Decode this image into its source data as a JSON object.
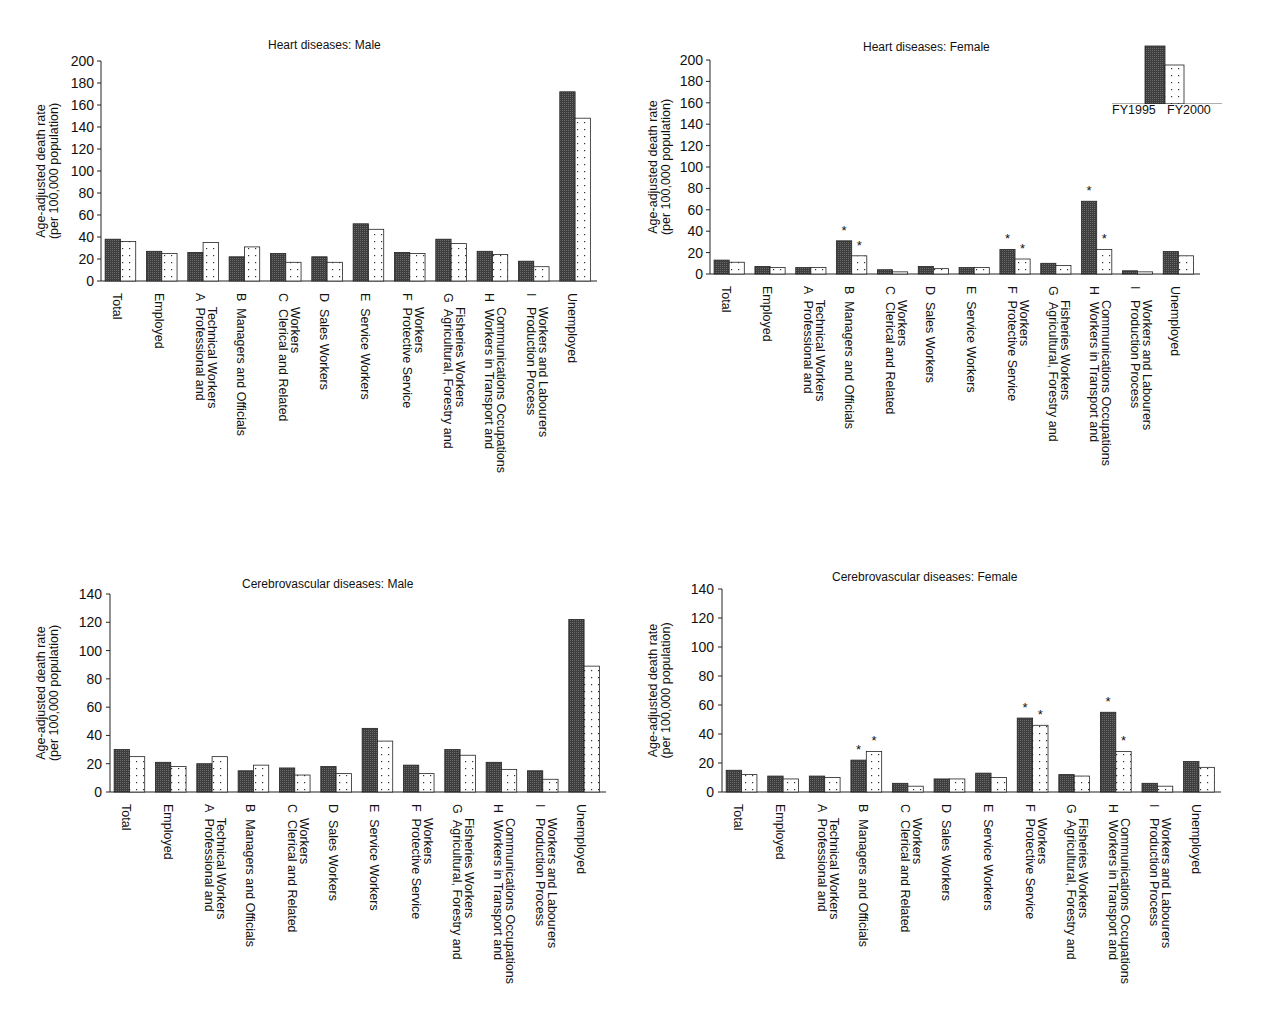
{
  "legend": {
    "series": [
      {
        "name": "FY1995",
        "pattern": "dark-crosshatch",
        "color": "#4a4a4a"
      },
      {
        "name": "FY2000",
        "pattern": "dotted",
        "color": "#ffffff"
      }
    ],
    "label": "FY1995 FY2000"
  },
  "chart_data": [
    {
      "type": "bar",
      "title": "Heart diseases: Male",
      "xlabel": "",
      "ylabel": "Age-adjusted death rate\n(per 100,000 population)",
      "ylim": [
        0,
        200
      ],
      "yticks": [
        0,
        20,
        40,
        60,
        80,
        100,
        120,
        140,
        160,
        180,
        200
      ],
      "categories": [
        "Total",
        "Employed",
        "A Professional and Technical Workers",
        "B Managers and Officials",
        "C Clerical and Related Workers",
        "D Sales Workers",
        "E Service Workers",
        "F Protective Service Workers",
        "G Agricultural, Forestry and Fisheries Workers",
        "H Workers in Transport and Communications Occupations",
        "I Production Process Workers and Labourers",
        "Unemployed"
      ],
      "series": [
        {
          "name": "FY1995",
          "values": [
            38,
            27,
            26,
            22,
            25,
            22,
            52,
            26,
            38,
            27,
            18,
            172
          ]
        },
        {
          "name": "FY2000",
          "values": [
            36,
            25,
            35,
            31,
            17,
            17,
            47,
            25,
            34,
            24,
            13,
            148
          ]
        }
      ],
      "significance": [],
      "grid": false,
      "legend_position": "none"
    },
    {
      "type": "bar",
      "title": "Heart diseases: Female",
      "xlabel": "",
      "ylabel": "Age-adjusted death rate\n(per 100,000 population)",
      "ylim": [
        0,
        200
      ],
      "yticks": [
        0,
        20,
        40,
        60,
        80,
        100,
        120,
        140,
        160,
        180,
        200
      ],
      "categories": [
        "Total",
        "Employed",
        "A Professional and Technical Workers",
        "B Managers and Officials",
        "C Clerical and Related Workers",
        "D Sales Workers",
        "E Service Workers",
        "F Protective Service Workers",
        "G Agricultural, Forestry and Fisheries Workers",
        "H Workers in Transport and Communications Occupations",
        "I Production Process Workers and Labourers",
        "Unemployed"
      ],
      "series": [
        {
          "name": "FY1995",
          "values": [
            13,
            7,
            6,
            31,
            4,
            7,
            6,
            23,
            10,
            68,
            3,
            21
          ]
        },
        {
          "name": "FY2000",
          "values": [
            11,
            6,
            6,
            17,
            2,
            5,
            6,
            14,
            8,
            23,
            2,
            17
          ]
        }
      ],
      "significance": [
        {
          "category": "B Managers and Officials",
          "series": [
            "FY1995",
            "FY2000"
          ],
          "marker": "*"
        },
        {
          "category": "F Protective Service Workers",
          "series": [
            "FY1995",
            "FY2000"
          ],
          "marker": "*"
        },
        {
          "category": "H Workers in Transport and Communications Occupations",
          "series": [
            "FY1995",
            "FY2000"
          ],
          "marker": "*"
        }
      ],
      "grid": false,
      "legend_position": "top-right"
    },
    {
      "type": "bar",
      "title": "Cerebrovascular diseases: Male",
      "xlabel": "",
      "ylabel": "Age-adjusted death rate\n(per 100,000 population)",
      "ylim": [
        0,
        140
      ],
      "yticks": [
        0,
        20,
        40,
        60,
        80,
        100,
        120,
        140
      ],
      "categories": [
        "Total",
        "Employed",
        "A Professional and Technical Workers",
        "B Managers and Officials",
        "C Clerical and Related Workers",
        "D Sales Workers",
        "E Service Workers",
        "F Protective Service Workers",
        "G Agricultural, Forestry and Fisheries Workers",
        "H Workers in Transport and Communications Occupations",
        "I Production Process Workers and Labourers",
        "Unemployed"
      ],
      "series": [
        {
          "name": "FY1995",
          "values": [
            30,
            21,
            20,
            15,
            17,
            18,
            45,
            19,
            30,
            21,
            15,
            122
          ]
        },
        {
          "name": "FY2000",
          "values": [
            25,
            18,
            25,
            19,
            12,
            13,
            36,
            13,
            26,
            16,
            9,
            89
          ]
        }
      ],
      "significance": [],
      "grid": false,
      "legend_position": "none"
    },
    {
      "type": "bar",
      "title": "Cerebrovascular diseases: Female",
      "xlabel": "",
      "ylabel": "Age-adjusted death rate\n(per 100,000 population)",
      "ylim": [
        0,
        140
      ],
      "yticks": [
        0,
        20,
        40,
        60,
        80,
        100,
        120,
        140
      ],
      "categories": [
        "Total",
        "Employed",
        "A Professional and Technical Workers",
        "B Managers and Officials",
        "C Clerical and Related Workers",
        "D Sales Workers",
        "E Service Workers",
        "F Protective Service Workers",
        "G Agricultural, Forestry and Fisheries Workers",
        "H Workers in Transport and Communications Occupations",
        "I Production Process Workers and Labourers",
        "Unemployed"
      ],
      "series": [
        {
          "name": "FY1995",
          "values": [
            15,
            11,
            11,
            22,
            6,
            9,
            13,
            51,
            12,
            55,
            6,
            21
          ]
        },
        {
          "name": "FY2000",
          "values": [
            12,
            9,
            10,
            28,
            4,
            9,
            10,
            46,
            11,
            28,
            4,
            17
          ]
        }
      ],
      "significance": [
        {
          "category": "B Managers and Officials",
          "series": [
            "FY1995",
            "FY2000"
          ],
          "marker": "*"
        },
        {
          "category": "F Protective Service Workers",
          "series": [
            "FY1995",
            "FY2000"
          ],
          "marker": "*"
        },
        {
          "category": "H Workers in Transport and Communications Occupations",
          "series": [
            "FY1995",
            "FY2000"
          ],
          "marker": "*"
        }
      ],
      "grid": false,
      "legend_position": "none"
    }
  ],
  "axis_label_lines": [
    [
      "Total"
    ],
    [
      "Employed"
    ],
    [
      "A  Professional and",
      "    Technical Workers"
    ],
    [
      "B  Managers and Officials"
    ],
    [
      "C  Clerical and Related",
      "    Workers"
    ],
    [
      "D  Sales Workers"
    ],
    [
      "E  Service Workers"
    ],
    [
      "F  Protective Service",
      "    Workers"
    ],
    [
      "G  Agricultural, Forestry and",
      "    Fisheries Workers"
    ],
    [
      "H  Workers in Transport and",
      "    Communications Occupations"
    ],
    [
      "I   Production Process",
      "    Workers and Labourers"
    ],
    [
      "Unemployed"
    ]
  ],
  "ylabel_lines": [
    "Age-adjusted death rate",
    "(per 100,000 population)"
  ]
}
